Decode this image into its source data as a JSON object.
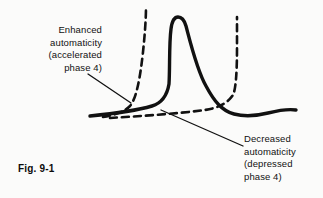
{
  "figure": {
    "caption": "Fig. 9-1",
    "background_color": "#fbfbfa",
    "ink_color": "#111111",
    "labels": {
      "enhanced": "Enhanced\nautomaticity\n(accelerated\nphase 4)",
      "decreased": "Decreased\nautomaticity\n(depressed\nphase 4)"
    },
    "traces": {
      "normal_action_potential": {
        "style": "solid",
        "description": "Cardiac action potential with phase 4 depolarization, rapid upstroke, plateau and repolarization"
      },
      "accelerated_phase4": {
        "style": "dashed",
        "description": "Steep phase 4 slope reaching threshold early, firing sooner"
      },
      "depressed_phase4": {
        "style": "dashed",
        "description": "Flattened phase 4 slope reaching threshold late, firing later"
      }
    },
    "leader_lines": [
      {
        "name": "enhanced-leader",
        "from": [
          88,
          74
        ],
        "to": [
          131,
          103
        ]
      },
      {
        "name": "decreased-leader",
        "from": [
          161,
          110
        ],
        "to": [
          243,
          146
        ]
      }
    ]
  }
}
